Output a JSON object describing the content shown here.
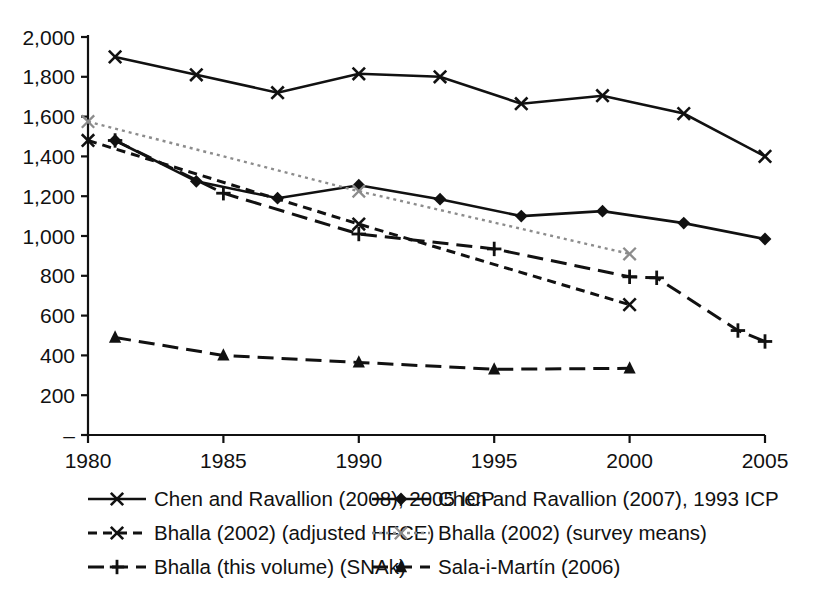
{
  "chart_data": {
    "type": "line",
    "title": "",
    "subtitle": "",
    "xlabel": "",
    "ylabel": "",
    "xlim": [
      1980,
      2005
    ],
    "ylim": [
      0,
      2000
    ],
    "grid": false,
    "legend_position": "bottom",
    "x_ticks": [
      1980,
      1985,
      1990,
      1995,
      2000,
      2005
    ],
    "x_tick_labels": [
      "1980",
      "1985",
      "1990",
      "1995",
      "2000",
      "2005"
    ],
    "y_ticks": [
      0,
      200,
      400,
      600,
      800,
      1000,
      1200,
      1400,
      1600,
      1800,
      2000
    ],
    "y_tick_labels": [
      "–",
      "200",
      "400",
      "600",
      "800",
      "1,000",
      "1,200",
      "1,400",
      "1,600",
      "1,800",
      "2,000"
    ],
    "series": [
      {
        "name": "Chen and Ravallion (2008), 2005 ICP",
        "color": "#111111",
        "dash": "none",
        "marker": "x",
        "x": [
          1981,
          1984,
          1987,
          1990,
          1993,
          1996,
          1999,
          2002,
          2005
        ],
        "values": [
          1900,
          1810,
          1720,
          1815,
          1800,
          1665,
          1705,
          1615,
          1400
        ]
      },
      {
        "name": "Chen and Ravallion (2007), 1993 ICP",
        "color": "#111111",
        "dash": "none",
        "marker": "diamond",
        "x": [
          1981,
          1984,
          1987,
          1990,
          1993,
          1996,
          1999,
          2002,
          2005
        ],
        "values": [
          1480,
          1275,
          1190,
          1255,
          1185,
          1100,
          1125,
          1065,
          985
        ]
      },
      {
        "name": "Bhalla (2002) (adjusted HFCE)",
        "color": "#111111",
        "dash": "short",
        "marker": "x",
        "x": [
          1980,
          1990,
          2000
        ],
        "values": [
          1480,
          1060,
          655
        ]
      },
      {
        "name": "Bhalla (2002) (survey means)",
        "color": "#8c8c8c",
        "dash": "dotted",
        "marker": "x",
        "x": [
          1980,
          1990,
          2000
        ],
        "values": [
          1575,
          1225,
          910
        ]
      },
      {
        "name": "Bhalla (this volume) (SNAk)",
        "color": "#111111",
        "dash": "long",
        "marker": "plus",
        "x": [
          1981,
          1985,
          1990,
          1995,
          2000,
          2001,
          2004,
          2005
        ],
        "values": [
          1480,
          1215,
          1010,
          935,
          795,
          790,
          525,
          470
        ]
      },
      {
        "name": "Sala-i-Martín (2006)",
        "color": "#111111",
        "dash": "long",
        "marker": "triangle",
        "x": [
          1981,
          1985,
          1990,
          1995,
          2000
        ],
        "values": [
          490,
          400,
          365,
          330,
          335
        ]
      }
    ]
  },
  "legend": {
    "entries": [
      {
        "label": "Chen and Ravallion (2008), 2005 ICP",
        "marker": "x",
        "dash": "none",
        "color": "#111111"
      },
      {
        "label": "Chen and Ravallion (2007), 1993 ICP",
        "marker": "diamond",
        "dash": "none",
        "color": "#111111"
      },
      {
        "label": "Bhalla (2002) (adjusted HFCE)",
        "marker": "x",
        "dash": "short",
        "color": "#111111"
      },
      {
        "label": "Bhalla (2002) (survey means)",
        "marker": "x",
        "dash": "dotted",
        "color": "#8c8c8c"
      },
      {
        "label": "Bhalla (this volume) (SNAk)",
        "marker": "plus",
        "dash": "long",
        "color": "#111111"
      },
      {
        "label": "Sala-i-Martín (2006)",
        "marker": "triangle",
        "dash": "long",
        "color": "#111111"
      }
    ]
  }
}
